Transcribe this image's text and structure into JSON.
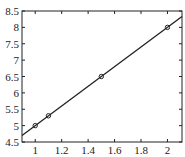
{
  "chart_data": {
    "type": "line",
    "title": "",
    "xlabel": "t",
    "ylabel": "",
    "xlim": [
      0.9,
      2.11
    ],
    "ylim": [
      4.5,
      8.5
    ],
    "x_ticks": [
      1,
      1.2,
      1.4,
      1.6,
      1.8,
      2
    ],
    "x_tick_labels": [
      "1",
      "1.2",
      "1.4",
      "1.6",
      "1.8",
      "2"
    ],
    "y_ticks": [
      4.5,
      5,
      5.5,
      6,
      6.5,
      7,
      7.5,
      8,
      8.5
    ],
    "y_tick_labels": [
      "4.5",
      "5",
      "5.5",
      "6",
      "6.5",
      "7",
      "7.5",
      "8",
      "8.5"
    ],
    "grid": false,
    "legend": null,
    "series": [
      {
        "name": "fit line",
        "style": "line",
        "color": "#222222",
        "x": [
          0.9,
          2.11
        ],
        "y": [
          4.7,
          8.33
        ]
      },
      {
        "name": "data points",
        "style": "markers-circle",
        "color": "#222222",
        "x": [
          1,
          1.1,
          1.5,
          2
        ],
        "y": [
          5.0,
          5.3,
          6.5,
          8.0
        ]
      }
    ]
  }
}
